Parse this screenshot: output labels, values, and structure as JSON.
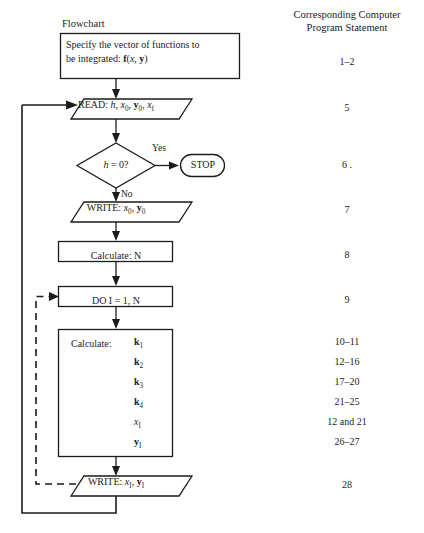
{
  "headers": {
    "left": "Flowchart",
    "right_line1": "Corresponding Computer",
    "right_line2": "Program Statement"
  },
  "nodes": {
    "specify_box": {
      "line1": "Specify the vector of functions to",
      "line2_prefix": "be integrated: ",
      "line2_f": "f",
      "line2_args_open": "(",
      "line2_x": "x",
      "line2_comma": ", ",
      "line2_y": "y",
      "line2_args_close": ")"
    },
    "read": {
      "keyword": "READ: ",
      "h": "h",
      "sep1": ", ",
      "x0": "x",
      "x0_sub": "0",
      "sep2": ", ",
      "y0": "y",
      "y0_sub": "0",
      "sep3": ", ",
      "xf": "x",
      "xf_sub": "f"
    },
    "decision": {
      "h": "h",
      "rest": " = 0?"
    },
    "yes_label": "Yes",
    "no_label": "No",
    "stop": "STOP",
    "write0": {
      "keyword": "WRITE: ",
      "x": "x",
      "x_sub": "0",
      "sep": ", ",
      "y": "y",
      "y_sub": "0"
    },
    "calculate_n": "Calculate: N",
    "do_loop": "DO I = 1, N",
    "calculate_block": {
      "label": "Calculate:",
      "items": [
        {
          "sym": "k",
          "sub": "1",
          "style": "bold"
        },
        {
          "sym": "k",
          "sub": "2",
          "style": "bold"
        },
        {
          "sym": "k",
          "sub": "3",
          "style": "bold"
        },
        {
          "sym": "k",
          "sub": "4",
          "style": "bold"
        },
        {
          "sym": "x",
          "sub": "I",
          "style": "italic"
        },
        {
          "sym": "y",
          "sub": "I",
          "style": "bold"
        }
      ]
    },
    "write1": {
      "keyword": "WRITE: ",
      "x": "x",
      "x_sub": "I",
      "sep": ", ",
      "y": "y",
      "y_sub": "I"
    }
  },
  "statement_numbers": [
    {
      "value": "1–2",
      "y": 62
    },
    {
      "value": "5",
      "y": 108
    },
    {
      "value": "6 .",
      "y": 165
    },
    {
      "value": "7",
      "y": 210
    },
    {
      "value": "8",
      "y": 255
    },
    {
      "value": "9",
      "y": 300
    },
    {
      "value": "10–11",
      "y": 342
    },
    {
      "value": "12–16",
      "y": 362
    },
    {
      "value": "17–20",
      "y": 382
    },
    {
      "value": "21–25",
      "y": 402
    },
    {
      "value": "12 and 21",
      "y": 422
    },
    {
      "value": "26–27",
      "y": 442
    },
    {
      "value": "28",
      "y": 485
    }
  ],
  "colors": {
    "ink": "#1b1b1b",
    "paper": "#ffffff"
  }
}
